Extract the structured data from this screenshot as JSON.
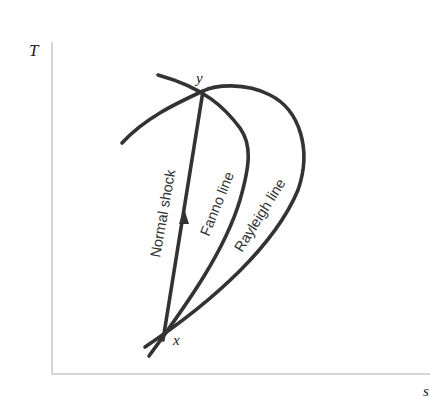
{
  "diagram": {
    "type": "T-s diagram",
    "axes": {
      "y_label": "T",
      "x_label": "s",
      "color": "#b8b8b8"
    },
    "curves": {
      "normal_shock": {
        "label": "Normal shock",
        "color": "#333333"
      },
      "fanno_line": {
        "label": "Fanno line",
        "color": "#333333"
      },
      "rayleigh_line": {
        "label": "Rayleigh line",
        "color": "#333333"
      }
    },
    "points": {
      "x": {
        "label": "x"
      },
      "y": {
        "label": "y"
      }
    }
  }
}
